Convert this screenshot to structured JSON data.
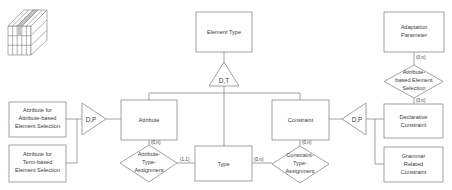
{
  "diagram": {
    "type": "er-diagram",
    "entities": {
      "element_type": "Element Type",
      "attribute": "Attribute",
      "constraint": "Constraint",
      "type": "Type",
      "attr_attr_sel": [
        "Attribute for",
        "Attribute-based",
        "Element Selection"
      ],
      "attr_term_sel": [
        "Attribute for",
        "Term-based",
        "Element Selection"
      ],
      "adaptation_param": [
        "Adaptation",
        "Parameter"
      ],
      "declarative": [
        "Declarative",
        "Constraint"
      ],
      "grammar": [
        "Grammar",
        "Related",
        "Constraint"
      ]
    },
    "relationships": {
      "attr_type_assign": [
        "Attribute-",
        "Type-",
        "Assignment"
      ],
      "constr_type_assign": [
        "Constraint-",
        "Type-",
        "Assignment"
      ],
      "attr_elem_sel": [
        "Attribute-",
        "based Element",
        "Selection"
      ]
    },
    "generalizations": {
      "dt": "D,T",
      "dp_left": "D,P",
      "dp_right": "D,P"
    },
    "cardinalities": {
      "attr_to_rel": "(0,n)",
      "rel_to_type_left": "(1,1)",
      "type_to_rel_right": "(0,n)",
      "constr_to_rel": "(0,n)",
      "adapt_to_rel": "(0,n)",
      "rel_to_decl": "(0,n)"
    }
  },
  "icon": {
    "name": "cube-icon"
  }
}
